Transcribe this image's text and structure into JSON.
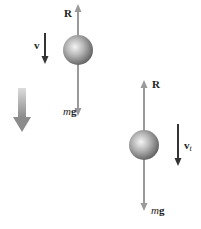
{
  "diagram": {
    "title": "",
    "colors": {
      "force_arrow": "#9a9a9a",
      "velocity_arrow": "#333333",
      "motion_arrow": "#a8a8a8",
      "ball_light": "#f2f2f2",
      "ball_dark": "#6a6a6a",
      "text": "#222222"
    },
    "motion_indicator": {
      "icon": "down-arrow-icon"
    },
    "ball_1": {
      "state": "accelerating",
      "velocity_label": "v",
      "resistance_label": "R",
      "weight_label_m": "m",
      "weight_label_g": "g"
    },
    "ball_2": {
      "state": "terminal velocity",
      "velocity_label": "v",
      "velocity_subscript": "t",
      "resistance_label": "R",
      "weight_label_m": "m",
      "weight_label_g": "g"
    }
  }
}
